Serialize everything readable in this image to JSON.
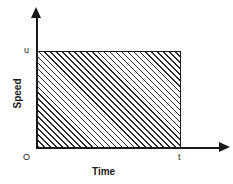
{
  "figure": {
    "background_color": "#ffffff",
    "line_color": "#1a1a1a"
  },
  "axes": {
    "y_title": "Speed",
    "x_title": "Time",
    "origin_label": "O",
    "y_tick_label": "u",
    "x_tick_label": "t"
  },
  "chart_data": {
    "type": "area",
    "title": "",
    "subtitle": "",
    "xlabel": "Time",
    "ylabel": "Speed",
    "x": [
      0,
      "t"
    ],
    "values": [
      "u",
      "u"
    ],
    "series": [
      {
        "name": "Speed",
        "values": [
          "u",
          "u"
        ]
      }
    ],
    "categories": [
      "0",
      "t"
    ],
    "xlim": [
      0,
      "t"
    ],
    "ylim": [
      0,
      "u"
    ],
    "x_tick_labels": [
      "O",
      "t"
    ],
    "y_tick_labels": [
      "u"
    ],
    "grid": false,
    "legend": "none",
    "annotations": [
      "Constant speed u maintained from time 0 to time t",
      "Shaded (hatched) rectangle represents distance travelled = u x t"
    ],
    "shaded_region": {
      "fill": "diagonal-hatch",
      "hatch_angle_degrees": 45,
      "x_from": "0",
      "x_to": "t",
      "y_from": "0",
      "y_to": "u"
    }
  }
}
